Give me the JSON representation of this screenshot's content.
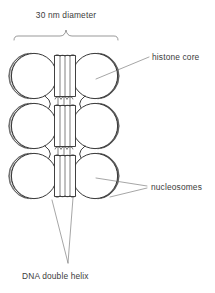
{
  "figure": {
    "title_visible": false,
    "background_color": "#ffffff",
    "ink_color": "#2b2b2b",
    "leader_color": "#6a6a6a"
  },
  "labels": {
    "top_measure": "30 nm diameter",
    "histone_core": "histone core",
    "nucleosomes": "nucleosomes",
    "dna_double_helix": "DNA double helix"
  },
  "annotations": {
    "brace": {
      "name": "dimension-brace",
      "x_start": 14,
      "x_end": 118,
      "y": 36,
      "tick_x": 66,
      "tick_y": 29
    },
    "leaders": [
      {
        "name": "histone-core-leader",
        "x1": 149,
        "y1": 57,
        "x2": 96,
        "y2": 79
      },
      {
        "name": "nucleosome-leader-upper",
        "x1": 147,
        "y1": 186,
        "x2": 96,
        "y2": 179
      },
      {
        "name": "nucleosome-leader-lower",
        "x1": 147,
        "y1": 188,
        "x2": 112,
        "y2": 196
      },
      {
        "name": "dna-leader-left",
        "x1": 68,
        "y1": 263,
        "x2": 52,
        "y2": 200
      },
      {
        "name": "dna-leader-right",
        "x1": 68,
        "y1": 263,
        "x2": 73,
        "y2": 198
      }
    ]
  },
  "structure": {
    "fiber_bounds": {
      "x": 12,
      "y": 47,
      "width": 106,
      "height": 155
    },
    "rows": [
      {
        "index": 0,
        "center_y": 76
      },
      {
        "index": 1,
        "center_y": 126
      },
      {
        "index": 2,
        "center_y": 176
      }
    ],
    "left_discs": [
      {
        "cx": 33,
        "cy": 76,
        "r": 23
      },
      {
        "cx": 33,
        "cy": 126,
        "r": 23
      },
      {
        "cx": 33,
        "cy": 176,
        "r": 23
      }
    ],
    "right_discs": [
      {
        "cx": 96,
        "cy": 76,
        "r": 23
      },
      {
        "cx": 96,
        "cy": 126,
        "r": 23
      },
      {
        "cx": 96,
        "cy": 176,
        "r": 23
      }
    ],
    "columns": [
      {
        "x": 54,
        "y": 55,
        "width": 22,
        "height": 42
      },
      {
        "x": 54,
        "y": 105,
        "width": 22,
        "height": 42
      },
      {
        "x": 54,
        "y": 155,
        "width": 22,
        "height": 42
      }
    ],
    "column_strand_count": 3,
    "coil_arcs_per_disc": 3,
    "linker_shape": "hourglass"
  },
  "text_positions": {
    "top_measure": {
      "x": 66,
      "y": 18,
      "anchor": "middle"
    },
    "histone_core": {
      "x": 152,
      "y": 60,
      "anchor": "start"
    },
    "nucleosomes": {
      "x": 151,
      "y": 190,
      "anchor": "start"
    },
    "dna_double_helix": {
      "x": 22,
      "y": 279,
      "anchor": "start"
    }
  }
}
